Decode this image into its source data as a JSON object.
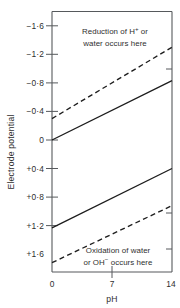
{
  "chart_data": {
    "type": "line",
    "title": "",
    "xlabel": "pH",
    "ylabel": "Electrode potential",
    "xlim": [
      0,
      14
    ],
    "ylim": [
      -1.8,
      1.85
    ],
    "y_inverted": true,
    "grid": false,
    "legend": "none",
    "x_ticks": [
      {
        "value": 0,
        "label": "0"
      },
      {
        "value": 7,
        "label": "7"
      },
      {
        "value": 14,
        "label": "14"
      }
    ],
    "y_ticks": [
      {
        "value": -1.6,
        "label": "−1·6"
      },
      {
        "value": -1.2,
        "label": "−1·2"
      },
      {
        "value": -0.8,
        "label": "−0·8"
      },
      {
        "value": -0.4,
        "label": "−0·4"
      },
      {
        "value": 0.0,
        "label": "0"
      },
      {
        "value": 0.4,
        "label": "+0·4"
      },
      {
        "value": 0.8,
        "label": "+0·8"
      },
      {
        "value": 1.2,
        "label": "+1·2"
      },
      {
        "value": 1.6,
        "label": "+1·6"
      }
    ],
    "series": [
      {
        "name": "hydrogen-overpotential-limit",
        "style": "dashed",
        "x": [
          0,
          14
        ],
        "y": [
          -0.3,
          -1.3
        ]
      },
      {
        "name": "hydrogen-equilibrium",
        "style": "solid",
        "x": [
          0,
          14
        ],
        "y": [
          0.0,
          -0.83
        ]
      },
      {
        "name": "oxygen-equilibrium",
        "style": "solid",
        "x": [
          0,
          14
        ],
        "y": [
          1.23,
          0.4
        ]
      },
      {
        "name": "oxygen-overpotential-limit",
        "style": "dashed",
        "x": [
          0,
          14
        ],
        "y": [
          1.72,
          0.92
        ]
      }
    ],
    "annotations": [
      {
        "name": "reduction-note",
        "lines": [
          "Reduction of H",
          "water occurs here"
        ],
        "superscript": "+",
        "tail": " or"
      },
      {
        "name": "oxidation-note",
        "lines": [
          "Oxidation of water",
          "or OH",
          "occurs here"
        ],
        "superscript": "−"
      }
    ]
  },
  "labels": {
    "y_axis_title": "Electrode potential",
    "x_axis_title": "pH",
    "reduction_line1_a": "Reduction of H",
    "reduction_line1_sup": "+",
    "reduction_line1_b": "or",
    "reduction_line2": "water occurs here",
    "oxidation_line1": "Oxidation of water",
    "oxidation_line2_a": "or OH",
    "oxidation_line2_sup": "−",
    "oxidation_line2_b": "occurs here"
  },
  "ticks": {
    "y0": "−1·6",
    "y1": "−1·2",
    "y2": "−0·8",
    "y3": "−0·4",
    "y4": "0",
    "y5": "+0·4",
    "y6": "+0·8",
    "y7": "+1·2",
    "y8": "+1·6",
    "x0": "0",
    "x1": "7",
    "x2": "14"
  },
  "colors": {
    "axis": "#56595c",
    "curve": "#1d1d1d",
    "text": "#2f2f2f",
    "background": "#ffffff"
  }
}
